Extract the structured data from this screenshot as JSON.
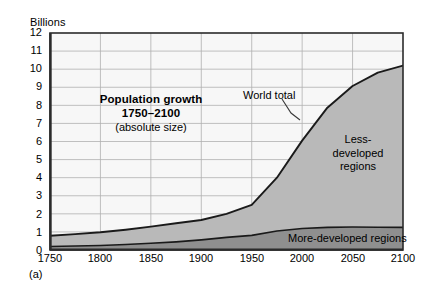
{
  "figure": {
    "caption": "(a)",
    "y_axis_unit": "Billions"
  },
  "chart_data": {
    "type": "area",
    "title": "Population growth",
    "title_line2": "1750–2100",
    "subtitle": "(absolute size)",
    "xlabel": "",
    "ylabel": "Billions",
    "xlim": [
      1750,
      2100
    ],
    "ylim": [
      0,
      12
    ],
    "grid": true,
    "stacked": true,
    "legend_position": "in-plot-labels",
    "x_ticks": [
      1750,
      1800,
      1850,
      1900,
      1950,
      2000,
      2050,
      2100
    ],
    "x_tick_labels": [
      "1750",
      "1800",
      "1850",
      "1900",
      "1950",
      "2000",
      "2050",
      "2100"
    ],
    "y_ticks": [
      0,
      1,
      2,
      3,
      4,
      5,
      6,
      7,
      8,
      9,
      10,
      11,
      12
    ],
    "y_tick_labels": [
      "0",
      "1",
      "2",
      "3",
      "4",
      "5",
      "6",
      "7",
      "8",
      "9",
      "10",
      "11",
      "12"
    ],
    "annotations": [
      {
        "name": "world-total",
        "text": "World total",
        "x": 2005,
        "y": 8.6,
        "leader_to_x": 2022,
        "leader_to_y": 7.2
      },
      {
        "name": "less-developed",
        "text": "Less-developed regions",
        "x": 2060,
        "y": 5.9
      },
      {
        "name": "more-developed",
        "text": "More-developed regions",
        "x": 2048,
        "y": 0.6
      }
    ],
    "x": [
      1750,
      1775,
      1800,
      1825,
      1850,
      1875,
      1900,
      1925,
      1950,
      1975,
      2000,
      2025,
      2050,
      2075,
      2100
    ],
    "series": [
      {
        "name": "More-developed regions",
        "color": "#8f8f8f",
        "values": [
          0.19,
          0.22,
          0.25,
          0.3,
          0.37,
          0.45,
          0.56,
          0.7,
          0.81,
          1.05,
          1.19,
          1.25,
          1.27,
          1.26,
          1.25
        ]
      },
      {
        "name": "Less-developed regions",
        "color": "#b9b9b9",
        "values": [
          0.6,
          0.66,
          0.73,
          0.82,
          0.92,
          1.03,
          1.1,
          1.3,
          1.69,
          2.95,
          4.86,
          6.62,
          7.8,
          8.55,
          8.95
        ]
      }
    ],
    "total_series": {
      "name": "World total",
      "color": "#1a1a1a",
      "values": [
        0.79,
        0.88,
        0.98,
        1.12,
        1.29,
        1.48,
        1.66,
        2.0,
        2.5,
        4.0,
        6.05,
        7.87,
        9.07,
        9.81,
        10.2
      ]
    },
    "colors": {
      "less_developed_fill": "#b9b9b9",
      "more_developed_fill": "#8f8f8f",
      "plot_background": "#f7f7f7",
      "grid_line": "#b0b0b0",
      "axis_line": "#2b2b2b",
      "curve_line": "#1a1a1a"
    }
  }
}
